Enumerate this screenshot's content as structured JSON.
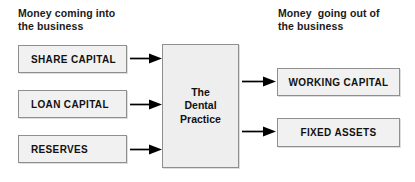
{
  "diagram": {
    "title_left": "Money coming into\nthe business",
    "title_right": "Money  going out of\nthe business",
    "centre": {
      "label": "The\nDental\nPractice"
    },
    "inputs": [
      {
        "label": "SHARE CAPITAL"
      },
      {
        "label": "LOAN CAPITAL"
      },
      {
        "label": "RESERVES"
      }
    ],
    "outputs": [
      {
        "label": "WORKING CAPITAL"
      },
      {
        "label": "FIXED ASSETS"
      }
    ],
    "arrows": [
      {
        "name": "share-capital-to-practice"
      },
      {
        "name": "loan-capital-to-practice"
      },
      {
        "name": "reserves-to-practice"
      },
      {
        "name": "practice-to-working-capital"
      },
      {
        "name": "practice-to-fixed-assets"
      }
    ],
    "colors": {
      "box_fill": "#f1f1f1",
      "centre_fill": "#eeeeee",
      "box_border": "#8f8f8f",
      "text": "#111111",
      "arrow": "#000000",
      "background": "#ffffff"
    }
  }
}
